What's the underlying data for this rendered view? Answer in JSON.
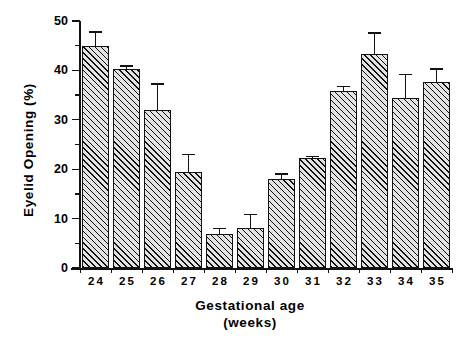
{
  "chart_data": {
    "type": "bar",
    "title": "",
    "xlabel": "Gestational  age",
    "xlabel_unit": "(weeks)",
    "ylabel": "Eyelid  Opening  (%)",
    "categories": [
      "24",
      "25",
      "26",
      "27",
      "28",
      "29",
      "30",
      "31",
      "32",
      "33",
      "34",
      "35"
    ],
    "values": [
      45.0,
      40.2,
      32.0,
      19.5,
      6.8,
      8.0,
      18.0,
      22.2,
      35.8,
      43.3,
      34.5,
      37.7
    ],
    "errors": [
      2.8,
      0.7,
      5.2,
      3.5,
      1.2,
      2.8,
      1.0,
      0.4,
      0.9,
      4.3,
      4.7,
      2.6
    ],
    "ylim": [
      0,
      50
    ],
    "yticks": [
      0,
      10,
      20,
      30,
      40,
      50
    ],
    "ytick_labels": [
      "0",
      "10",
      "20",
      "30",
      "40",
      "50"
    ],
    "yminor_ticks": [
      5,
      15,
      25,
      35,
      45
    ],
    "grid": false,
    "legend": null,
    "bar_facecolor": "#e3e3e3",
    "bar_hatch": "diagonal-///",
    "bar_edgecolor": "#111111",
    "error_kind": "upper-only-whisker"
  }
}
